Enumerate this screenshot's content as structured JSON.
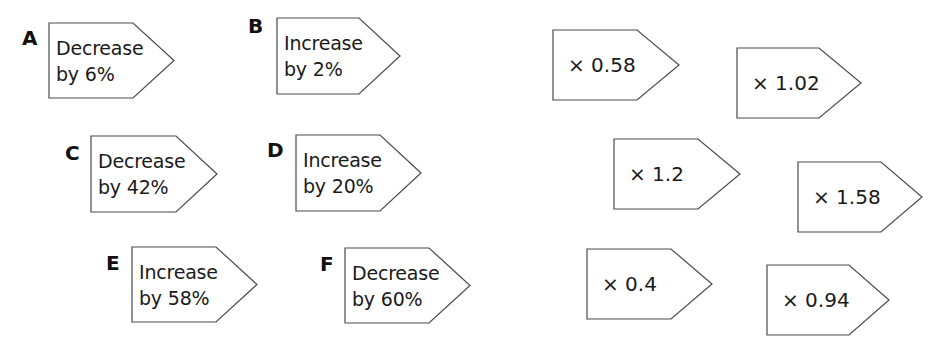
{
  "cards": [
    {
      "letter": "A",
      "line1": "Decrease",
      "line2": "by 6%",
      "x": 49,
      "y": 23,
      "w": 84,
      "h": 75,
      "tipx": 174,
      "lx": 22,
      "ly": 28
    },
    {
      "letter": "B",
      "line1": "Increase",
      "line2": "by 2%",
      "x": 277,
      "y": 18,
      "w": 82,
      "h": 76,
      "tipx": 400,
      "lx": 248,
      "ly": 16
    },
    {
      "letter": "C",
      "line1": "Decrease",
      "line2": "by 42%",
      "x": 91,
      "y": 136,
      "w": 85,
      "h": 76,
      "tipx": 217,
      "lx": 65,
      "ly": 143
    },
    {
      "letter": "D",
      "line1": "Increase",
      "line2": "by 20%",
      "x": 296,
      "y": 135,
      "w": 84,
      "h": 76,
      "tipx": 421,
      "lx": 267,
      "ly": 140
    },
    {
      "letter": "E",
      "line1": "Increase",
      "line2": "by 58%",
      "x": 132,
      "y": 247,
      "w": 84,
      "h": 75,
      "tipx": 257,
      "lx": 106,
      "ly": 253
    },
    {
      "letter": "F",
      "line1": "Decrease",
      "line2": "by 60%",
      "x": 345,
      "y": 248,
      "w": 84,
      "h": 75,
      "tipx": 470,
      "lx": 320,
      "ly": 254
    }
  ],
  "multipliers": [
    {
      "label": "× 0.58",
      "x": 553,
      "y": 30,
      "w": 84,
      "h": 70,
      "tipx": 679
    },
    {
      "label": "× 1.02",
      "x": 737,
      "y": 48,
      "w": 82,
      "h": 70,
      "tipx": 861
    },
    {
      "label": "× 1.2",
      "x": 614,
      "y": 139,
      "w": 84,
      "h": 70,
      "tipx": 740
    },
    {
      "label": "× 1.58",
      "x": 798,
      "y": 162,
      "w": 83,
      "h": 70,
      "tipx": 922
    },
    {
      "label": "× 0.4",
      "x": 587,
      "y": 249,
      "w": 84,
      "h": 70,
      "tipx": 712
    },
    {
      "label": "× 0.94",
      "x": 767,
      "y": 265,
      "w": 82,
      "h": 70,
      "tipx": 889
    }
  ],
  "colors": {
    "stroke": "#4a4a4a",
    "text": "#1a1a1a",
    "background": "#ffffff"
  }
}
